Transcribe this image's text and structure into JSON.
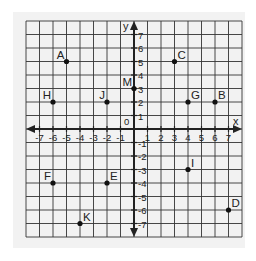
{
  "chart_data": {
    "type": "scatter",
    "title": "",
    "xlabel": "x",
    "ylabel": "y",
    "xlim": [
      -8,
      8
    ],
    "ylim": [
      -8,
      8
    ],
    "grid": true,
    "x_ticks": [
      -7,
      -6,
      -5,
      -4,
      -3,
      -2,
      -1,
      1,
      2,
      3,
      4,
      5,
      6,
      7
    ],
    "y_ticks": [
      -7,
      -6,
      -5,
      -4,
      -3,
      -2,
      -1,
      1,
      2,
      3,
      4,
      5,
      6,
      7
    ],
    "origin_label": "0",
    "points": [
      {
        "label": "A",
        "x": -5,
        "y": 5
      },
      {
        "label": "B",
        "x": 6,
        "y": 2
      },
      {
        "label": "C",
        "x": 3,
        "y": 5
      },
      {
        "label": "D",
        "x": 7,
        "y": -6
      },
      {
        "label": "E",
        "x": -2,
        "y": -4
      },
      {
        "label": "F",
        "x": -6,
        "y": -4
      },
      {
        "label": "G",
        "x": 4,
        "y": 2
      },
      {
        "label": "H",
        "x": -6,
        "y": 2
      },
      {
        "label": "I",
        "x": 4,
        "y": -3
      },
      {
        "label": "J",
        "x": -2,
        "y": 2
      },
      {
        "label": "K",
        "x": -4,
        "y": -7
      },
      {
        "label": "M",
        "x": 0,
        "y": 3
      }
    ]
  },
  "colors": {
    "background": "#ffffff",
    "panel": "#f2f2f2",
    "grid": "#333333",
    "axis": "#222222",
    "point": "#111111",
    "text": "#222222"
  }
}
